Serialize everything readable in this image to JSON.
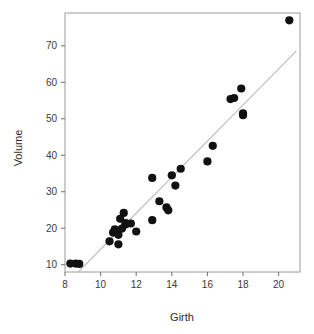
{
  "chart_data": {
    "type": "scatter",
    "title": "",
    "xlabel": "Girth",
    "ylabel": "Volume",
    "xlim": [
      8.0,
      21.2
    ],
    "ylim": [
      8.0,
      79.0
    ],
    "xticks": [
      8,
      10,
      12,
      14,
      16,
      18,
      20
    ],
    "yticks": [
      10,
      20,
      30,
      40,
      50,
      60,
      70
    ],
    "grid": false,
    "legend": null,
    "point_color": "#111111",
    "line_color": "#bdbdbd",
    "frame_color": "#9a9a9a",
    "series": [
      {
        "name": "Trees",
        "marker": "filled-circle",
        "x": [
          8.3,
          8.6,
          8.8,
          10.5,
          10.7,
          10.8,
          11.0,
          11.0,
          11.1,
          11.2,
          11.3,
          11.4,
          11.4,
          11.7,
          12.0,
          12.9,
          12.9,
          13.3,
          13.7,
          13.8,
          14.0,
          14.2,
          14.5,
          16.0,
          16.3,
          17.3,
          17.5,
          17.9,
          18.0,
          18.0,
          20.6
        ],
        "y": [
          10.3,
          10.3,
          10.2,
          16.4,
          18.8,
          19.7,
          15.6,
          18.2,
          22.6,
          19.9,
          24.2,
          21.0,
          21.4,
          21.3,
          19.1,
          22.2,
          33.8,
          27.4,
          25.7,
          24.9,
          34.5,
          31.7,
          36.3,
          38.3,
          42.6,
          55.4,
          55.7,
          58.3,
          51.5,
          51.0,
          77.0
        ]
      }
    ],
    "fit_line": {
      "name": "linear-regression",
      "x_start": 8.74,
      "y_start": 8.0,
      "x_end": 21.0,
      "y_end": 68.6
    }
  },
  "axes": {
    "x_title": "Girth",
    "y_title": "Volume",
    "x_tick_labels": [
      "8",
      "10",
      "12",
      "14",
      "16",
      "18",
      "20"
    ],
    "y_tick_labels": [
      "10",
      "20",
      "30",
      "40",
      "50",
      "60",
      "70"
    ]
  }
}
